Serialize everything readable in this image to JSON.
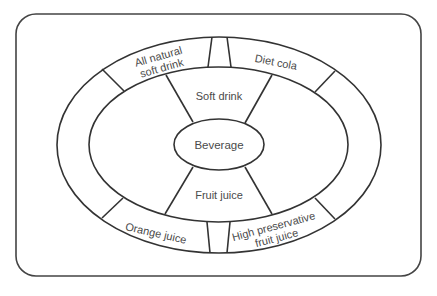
{
  "diagram": {
    "type": "concept-hierarchy-ellipse",
    "center": {
      "label": "Beverage"
    },
    "middle_ring": {
      "top": {
        "label": "Soft drink"
      },
      "bottom": {
        "label": "Fruit juice"
      }
    },
    "outer_ring": {
      "top_left": {
        "line1": "All natural",
        "line2": "soft drink"
      },
      "top_right": {
        "label": "Diet cola"
      },
      "bottom_left": {
        "label": "Orange juice"
      },
      "bottom_right": {
        "line1": "High preservative",
        "line2": "fruit juice"
      }
    },
    "colors": {
      "line": "#333333",
      "text": "#4a4a4a",
      "background": "#ffffff"
    }
  }
}
